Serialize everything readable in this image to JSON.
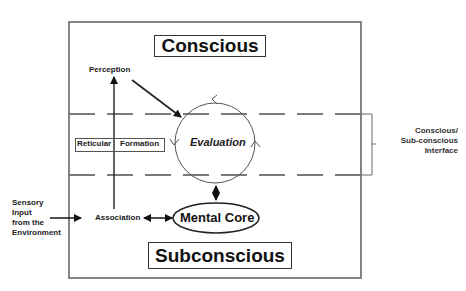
{
  "diagram": {
    "regions": {
      "top_label": "Conscious",
      "bottom_label": "Subconscious"
    },
    "nodes": {
      "perception": "Perception",
      "evaluation": "Evaluation",
      "reticular_formation_a": "Reticular",
      "reticular_formation_b": "Formation",
      "association": "Association",
      "mental_core": "Mental Core"
    },
    "interface_label": {
      "line1": "Conscious/",
      "line2": "Sub-conscious",
      "line3": "Interface"
    },
    "sensory_input": {
      "line1": "Sensory",
      "line2": "Input",
      "line3": "from the",
      "line4": "Environment"
    },
    "colors": {
      "stroke": "#555555",
      "dash": "#7a7a7a",
      "text": "#1a1a1a"
    }
  }
}
